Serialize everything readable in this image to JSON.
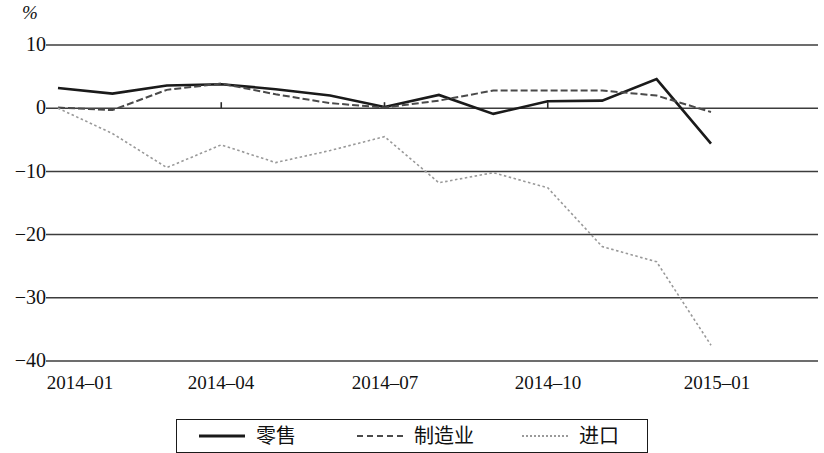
{
  "chart_data": {
    "type": "line",
    "title": "",
    "subtitle": "",
    "xlabel": "",
    "ylabel": "%",
    "unit_label": "%",
    "ylim": [
      -40,
      10
    ],
    "yticks": [
      10,
      0,
      -10,
      -20,
      -30,
      -40
    ],
    "ytick_labels": [
      "10",
      "0",
      "−10",
      "−20",
      "−30",
      "−40"
    ],
    "grid": "horizontal",
    "legend_position": "bottom",
    "x": [
      "2014-01",
      "2014-02",
      "2014-03",
      "2014-04",
      "2014-05",
      "2014-06",
      "2014-07",
      "2014-08",
      "2014-09",
      "2014-10",
      "2014-11",
      "2014-12",
      "2015-01"
    ],
    "xtick_labels": [
      "2014–01",
      "2014–04",
      "2014–07",
      "2014–10",
      "2015–01"
    ],
    "xtick_indices": [
      0,
      3,
      6,
      9,
      12
    ],
    "series": [
      {
        "name": "零售",
        "style": "solid",
        "color": "#1a1a1a",
        "width": 2.6,
        "values": [
          3.2,
          2.3,
          3.6,
          3.8,
          3.0,
          2.0,
          0.2,
          2.1,
          -0.9,
          1.1,
          1.2,
          4.6,
          -5.6
        ]
      },
      {
        "name": "制造业",
        "style": "dashed",
        "color": "#4a4a4a",
        "width": 2.0,
        "values": [
          0.1,
          -0.3,
          2.9,
          3.9,
          2.2,
          0.8,
          0.1,
          1.2,
          2.8,
          2.8,
          2.8,
          2.0,
          -0.6
        ]
      },
      {
        "name": "进口",
        "style": "dotted",
        "color": "#999999",
        "width": 1.6,
        "values": [
          0.0,
          -4.0,
          -9.4,
          -5.8,
          -8.6,
          -6.7,
          -4.5,
          -11.8,
          -10.2,
          -12.6,
          -21.9,
          -24.3,
          -37.5
        ]
      }
    ]
  },
  "legend": {
    "items": [
      {
        "label": "零售",
        "style": "solid"
      },
      {
        "label": "制造业",
        "style": "dashed"
      },
      {
        "label": "进口",
        "style": "dotted"
      }
    ]
  },
  "axis": {
    "unit": "%"
  }
}
